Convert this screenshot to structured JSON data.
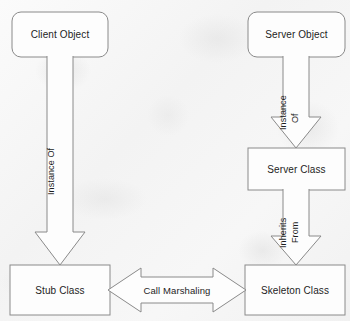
{
  "diagram": {
    "stroke_color": "#8a8a8a",
    "fill_color": "#fdfdfd",
    "text_color": "#1d1d1d",
    "background_color": "#f4f4f4",
    "nodes": [
      {
        "id": "client-object",
        "label": "Client Object",
        "shape": "rounded-rectangle",
        "x": 12,
        "y": 12,
        "w": 96,
        "h": 45
      },
      {
        "id": "server-object",
        "label": "Server Object",
        "shape": "rounded-rectangle",
        "x": 248,
        "y": 12,
        "w": 97,
        "h": 45
      },
      {
        "id": "server-class",
        "label": "Server Class",
        "shape": "rectangle",
        "x": 248,
        "y": 148,
        "w": 97,
        "h": 42
      },
      {
        "id": "stub-class",
        "label": "Stub Class",
        "shape": "rectangle",
        "x": 10,
        "y": 265,
        "w": 100,
        "h": 50
      },
      {
        "id": "skeleton-class",
        "label": "Skeleton Class",
        "shape": "rectangle",
        "x": 245,
        "y": 265,
        "w": 100,
        "h": 50
      }
    ],
    "edges": [
      {
        "id": "client-to-stub",
        "from": "client-object",
        "to": "stub-class",
        "label": "Instance Of",
        "label_lines": [
          "Instance Of"
        ],
        "direction": "down",
        "style": "block-arrow"
      },
      {
        "id": "serverobject-to-serverclass",
        "from": "server-object",
        "to": "server-class",
        "label": "Instance Of",
        "label_lines": [
          "Instance",
          "Of"
        ],
        "direction": "down",
        "style": "block-arrow"
      },
      {
        "id": "serverclass-to-skeleton",
        "from": "server-class",
        "to": "skeleton-class",
        "label": "Inherits From",
        "label_lines": [
          "Inherits",
          "From"
        ],
        "direction": "down",
        "style": "block-arrow"
      },
      {
        "id": "stub-to-skeleton",
        "from": "stub-class",
        "to": "skeleton-class",
        "label": "Call Marshaling",
        "label_lines": [
          "Call Marshaling"
        ],
        "direction": "bidirectional",
        "style": "double-block-arrow"
      }
    ]
  }
}
